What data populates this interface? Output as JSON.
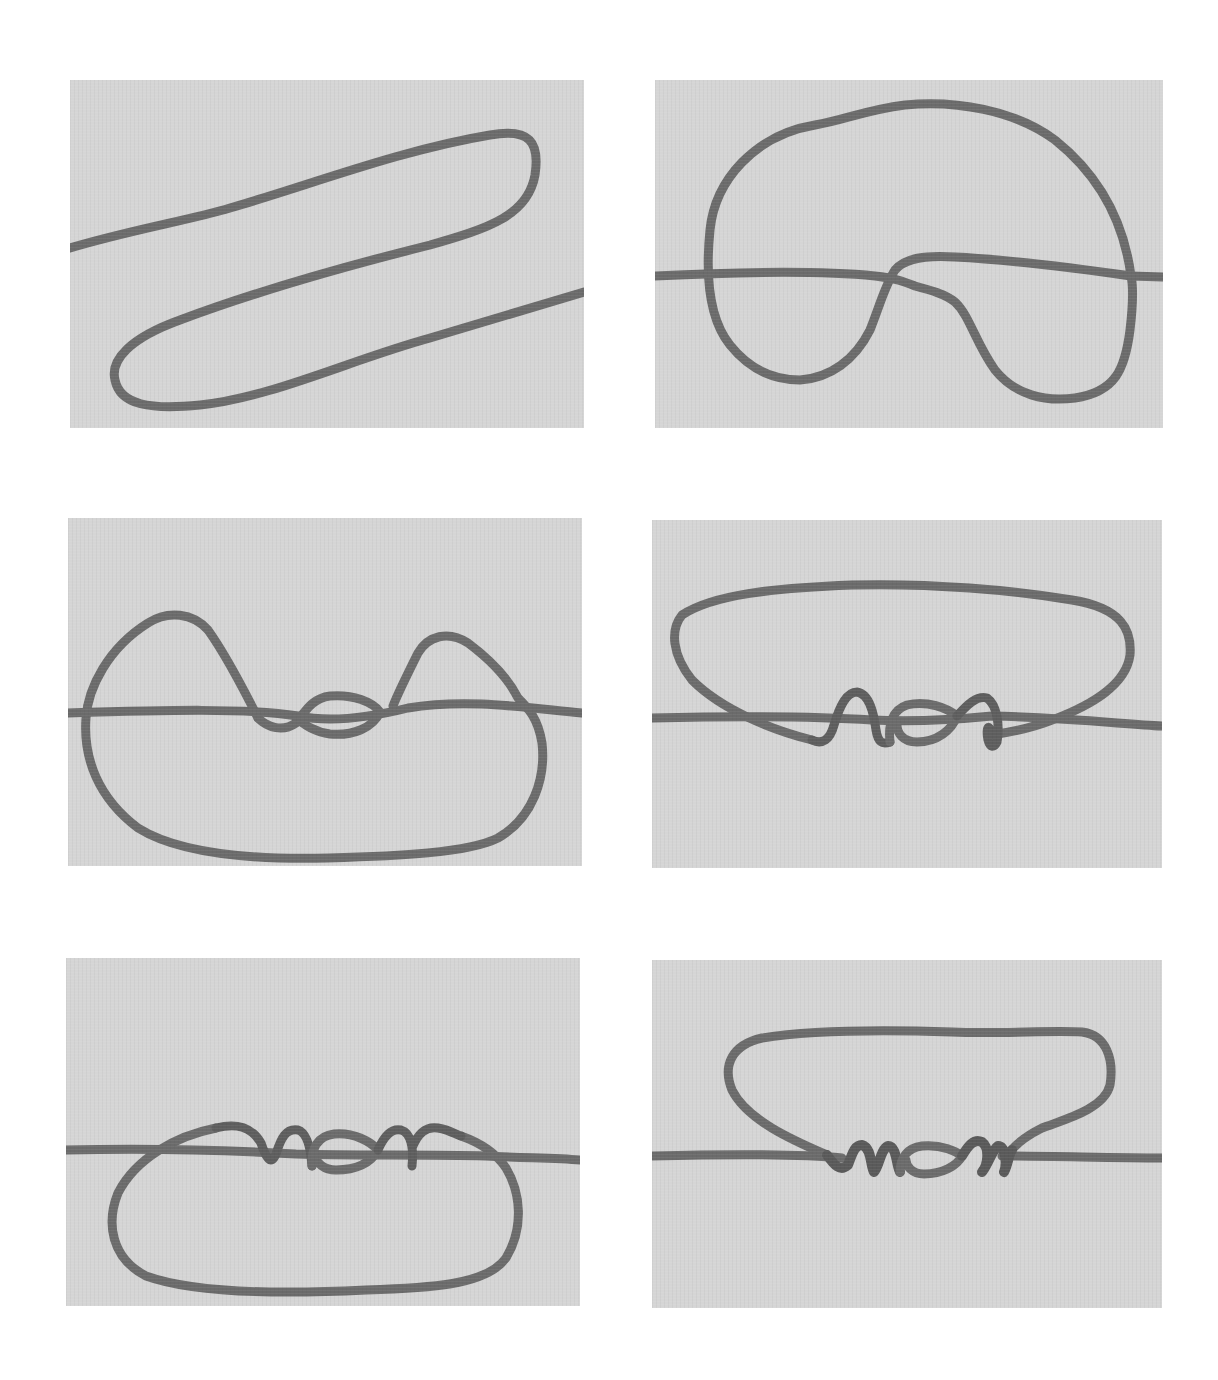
{
  "figure": {
    "colors": {
      "page_background": "#ffffff",
      "panel_background": "#d5d5d5",
      "rope": "#6b6b6b",
      "rope_shadow": "#555555"
    },
    "panels": [
      {
        "step": 1,
        "position": "top-left",
        "content": "rope laid in an S-shaped zigzag with two long parallel bights"
      },
      {
        "step": 2,
        "position": "top-right",
        "content": "large loop formed over the horizontal standing part, with a twist crossing near the center"
      },
      {
        "step": 3,
        "position": "middle-left",
        "content": "two upper ears/bights formed either side of a central small loop on the horizontal line; large loop below"
      },
      {
        "step": 4,
        "position": "middle-right",
        "content": "large loop above; wraps forming around the horizontal line on both sides of a central eye"
      },
      {
        "step": 5,
        "position": "bottom-left",
        "content": "wrap turns around the horizontal line with a central eye; large loop below"
      },
      {
        "step": 6,
        "position": "bottom-right",
        "content": "knot nearly finished: coils dressed on both sides of the central eye, large loop above"
      }
    ]
  }
}
